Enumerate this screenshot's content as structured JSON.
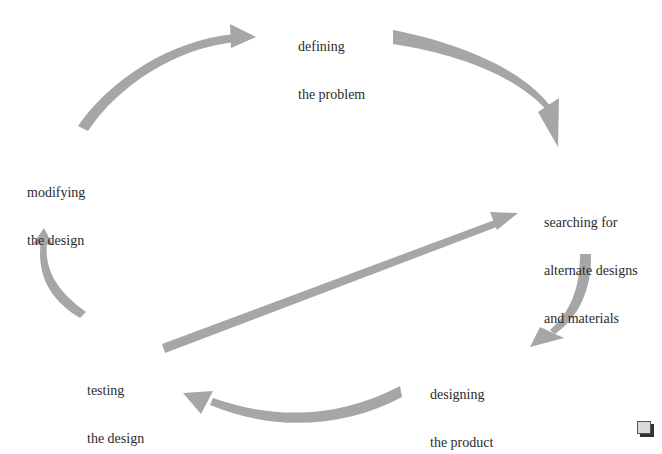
{
  "diagram": {
    "type": "cycle",
    "arrow_color": "#a6a6a6",
    "text_color": "#2b2b2b",
    "steps": [
      {
        "id": "define",
        "line1": "defining",
        "line2": "the problem"
      },
      {
        "id": "search",
        "line1": "searching for",
        "line2": "alternate designs",
        "line3": "and materials"
      },
      {
        "id": "design",
        "line1": "designing",
        "line2": "the product"
      },
      {
        "id": "test",
        "line1": "testing",
        "line2": "the design"
      },
      {
        "id": "modify",
        "line1": "modifying",
        "line2": "the design"
      }
    ],
    "arrows": [
      {
        "from": "modify",
        "to": "define"
      },
      {
        "from": "define",
        "to": "search"
      },
      {
        "from": "search",
        "to": "design"
      },
      {
        "from": "design",
        "to": "test"
      },
      {
        "from": "test",
        "to": "modify"
      },
      {
        "from": "test",
        "to": "search"
      }
    ]
  }
}
